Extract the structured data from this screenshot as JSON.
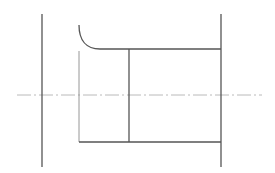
{
  "drawing": {
    "width": 275,
    "height": 173,
    "background": "#ffffff",
    "line_color": "#555555",
    "thin_line_color": "#8a8a8a",
    "centerline_color": "#a8a8a8",
    "outline_width": 1.3,
    "thin_width": 0.9,
    "centerline": {
      "x1": 17,
      "y1": 95,
      "x2": 262,
      "y2": 95,
      "dash": "14 3 2 3"
    },
    "left_face": {
      "x1": 42,
      "y1": 14,
      "x2": 42,
      "y2": 167
    },
    "right_face": {
      "x1": 221,
      "y1": 14,
      "x2": 221,
      "y2": 167
    },
    "fillet_arc": {
      "d": "M79 25 C79 40, 86 49, 100 49"
    },
    "top_edge": {
      "x1": 100,
      "y1": 49,
      "x2": 221,
      "y2": 49
    },
    "inner_left_edge": {
      "x1": 79,
      "y1": 51,
      "x2": 79,
      "y2": 142
    },
    "step_edge": {
      "x1": 129,
      "y1": 49,
      "x2": 129,
      "y2": 142
    },
    "bottom_edge": {
      "x1": 79,
      "y1": 142,
      "x2": 221,
      "y2": 142
    }
  }
}
